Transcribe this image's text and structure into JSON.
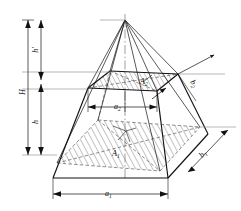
{
  "figure": {
    "type": "engineering-drawing",
    "background_color": "#ffffff",
    "line_color": "#111111",
    "hatch_color": "#222222"
  },
  "dimensions": {
    "total_height": {
      "label": "H",
      "orientation": "vertical",
      "position": "outer-left"
    },
    "upper_height": {
      "label": "h'",
      "orientation": "vertical",
      "position": "inner-left-upper"
    },
    "lower_height": {
      "label": "h",
      "orientation": "vertical",
      "position": "inner-left-lower"
    },
    "base_width": {
      "label": "a",
      "subscript": "1",
      "orientation": "horizontal",
      "position": "bottom"
    },
    "top_width": {
      "label": "a",
      "subscript": "2",
      "orientation": "horizontal",
      "position": "middle"
    },
    "base_depth": {
      "label": "b",
      "subscript": "1",
      "orientation": "diagonal",
      "position": "lower-right"
    },
    "top_depth": {
      "label": "b",
      "subscript": "2",
      "orientation": "diagonal",
      "position": "upper-right"
    }
  },
  "areas": {
    "base_area": {
      "label": "A",
      "subscript": "1",
      "description": "lower hatched cross-section"
    },
    "top_area": {
      "label": "A",
      "subscript": "2",
      "description": "upper hatched cross-section"
    }
  },
  "labels": {
    "H": "H",
    "h_prime": "h'",
    "h": "h",
    "a1_base": "a",
    "a1_sub": "1",
    "a2_base": "a",
    "a2_sub": "2",
    "b1_base": "b",
    "b1_sub": "1",
    "b2_base": "b",
    "b2_sub": "2",
    "A1_base": "A",
    "A1_sub": "1",
    "A2_base": "A",
    "A2_sub": "2"
  }
}
